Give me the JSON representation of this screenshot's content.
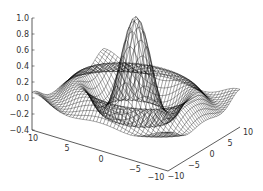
{
  "chart_data": {
    "type": "surface",
    "title": "",
    "function": "sin(r)/r, r = sqrt(x^2 + y^2)",
    "x": {
      "label": "",
      "range": [
        -10,
        10
      ],
      "ticks": [
        10,
        5,
        0,
        -5,
        -10
      ]
    },
    "y": {
      "label": "",
      "range": [
        -10,
        10
      ],
      "ticks": [
        -10,
        -5,
        0,
        5,
        10
      ]
    },
    "z": {
      "label": "",
      "range": [
        -0.4,
        1.0
      ],
      "ticks": [
        1.0,
        0.8,
        0.6,
        0.4,
        0.2,
        0.0,
        -0.2,
        -0.4
      ]
    },
    "style": "wireframe mesh, black lines on white",
    "peak": {
      "x": 0,
      "y": 0,
      "z": 1.0
    },
    "grid": false,
    "legend": null
  },
  "axes": {
    "z_ticks": [
      "1.0",
      "0.8",
      "0.6",
      "0.4",
      "0.2",
      "0.0",
      "−0.2",
      "−0.4"
    ],
    "x_ticks": [
      "10",
      "5",
      "0",
      "−5",
      "−10"
    ],
    "y_ticks": [
      "−10",
      "−5",
      "0",
      "5",
      "10"
    ]
  },
  "colors": {
    "mesh": "#000000",
    "axis": "#333333",
    "background": "#ffffff"
  }
}
